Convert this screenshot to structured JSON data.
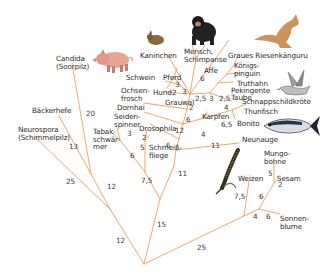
{
  "diagram": {
    "type": "phylogenetic-tree",
    "line_color": "#f0a868",
    "taxa": [
      {
        "id": "candida",
        "label": "Candida\n(Soorpilz)"
      },
      {
        "id": "baeckerhefe",
        "label": "Bäckerhefe"
      },
      {
        "id": "neurospora",
        "label": "Neurospora\n(Schimmelpilz)"
      },
      {
        "id": "tabakschwaermer",
        "label": "Tabak-\nschwär-\nmer"
      },
      {
        "id": "seidenspinner",
        "label": "Seiden-\nspinner"
      },
      {
        "id": "drosophila",
        "label": "Drosophila"
      },
      {
        "id": "schmeissfliege",
        "label": "Schmeiß-\nfliege"
      },
      {
        "id": "dornhai",
        "label": "Dornhai"
      },
      {
        "id": "ochsenfrosch",
        "label": "Ochsen-\nfrosch"
      },
      {
        "id": "schwein",
        "label": "Schwein"
      },
      {
        "id": "pferd",
        "label": "Pferd"
      },
      {
        "id": "hund",
        "label": "Hund"
      },
      {
        "id": "kaninchen",
        "label": "Kaninchen"
      },
      {
        "id": "grauwal",
        "label": "Grauwal"
      },
      {
        "id": "mensch",
        "label": "Mensch,\nSchimpanse"
      },
      {
        "id": "affe",
        "label": "Affe"
      },
      {
        "id": "kaenguru",
        "label": "Graues Riesenkänguru"
      },
      {
        "id": "koenigspinguin",
        "label": "Königs-\npinguin"
      },
      {
        "id": "truthahn",
        "label": "Truthahn"
      },
      {
        "id": "pekingente",
        "label": "Pekingente"
      },
      {
        "id": "taube",
        "label": "Taube"
      },
      {
        "id": "schnappschildkroete",
        "label": "Schnappschildkröte"
      },
      {
        "id": "karpfen",
        "label": "Karpfen"
      },
      {
        "id": "thunfisch",
        "label": "Thunfisch"
      },
      {
        "id": "bonito",
        "label": "Bonito"
      },
      {
        "id": "neunauge",
        "label": "Neunauge"
      },
      {
        "id": "weizen",
        "label": "Weizen"
      },
      {
        "id": "mungobohne",
        "label": "Mungo-\nbohne"
      },
      {
        "id": "sesam",
        "label": "Sesam"
      },
      {
        "id": "sonnenblume",
        "label": "Sonnen-\nblume"
      }
    ],
    "branch_lengths": [
      {
        "id": "b_root_left",
        "value": "12"
      },
      {
        "id": "b_root_right",
        "value": "25"
      },
      {
        "id": "b_fungi",
        "value": "25"
      },
      {
        "id": "b_fungi_inner",
        "value": "12"
      },
      {
        "id": "b_baeckerhefe",
        "value": "13"
      },
      {
        "id": "b_candida",
        "value": "20"
      },
      {
        "id": "b_animals",
        "value": "15"
      },
      {
        "id": "b_insects",
        "value": "7,5"
      },
      {
        "id": "b_tabak",
        "value": "6"
      },
      {
        "id": "b_seiden",
        "value": "3"
      },
      {
        "id": "b_flies",
        "value": "5"
      },
      {
        "id": "b_drosophila",
        "value": "2"
      },
      {
        "id": "b_vertebrates",
        "value": "11"
      },
      {
        "id": "b_neunauge",
        "value": "11"
      },
      {
        "id": "b_v1",
        "value": "6"
      },
      {
        "id": "b_dornhai",
        "value": "12"
      },
      {
        "id": "b_v2",
        "value": "6"
      },
      {
        "id": "b_fish",
        "value": "4"
      },
      {
        "id": "b_bonito",
        "value": "6,5"
      },
      {
        "id": "b_v3",
        "value": "2"
      },
      {
        "id": "b_birds",
        "value": "2,5"
      },
      {
        "id": "b_birds2",
        "value": "3"
      },
      {
        "id": "b_birds3",
        "value": "2,5"
      },
      {
        "id": "b_schildkroete",
        "value": "4"
      },
      {
        "id": "b_affe",
        "value": "6"
      },
      {
        "id": "b_pferd",
        "value": "3"
      },
      {
        "id": "b_hund",
        "value": "2"
      },
      {
        "id": "b_mammal",
        "value": "3"
      },
      {
        "id": "b_plants_weizen",
        "value": "7,5"
      },
      {
        "id": "b_plants",
        "value": "4"
      },
      {
        "id": "b_dicots",
        "value": "6"
      },
      {
        "id": "b_mungo",
        "value": "5"
      },
      {
        "id": "b_sesam",
        "value": "2"
      },
      {
        "id": "b_sonnenblume",
        "value": "6"
      }
    ],
    "illustrations": [
      "pig",
      "rabbit",
      "chimpanzee",
      "kangaroo",
      "goose",
      "tuna",
      "wheat-ear"
    ]
  }
}
